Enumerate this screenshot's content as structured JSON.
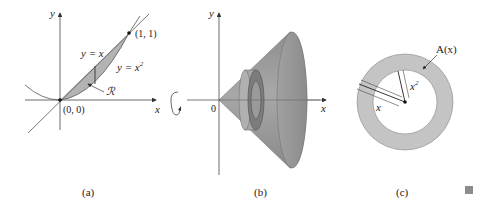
{
  "figure": {
    "panels": [
      {
        "id": "a",
        "caption": "(a)",
        "axis_x_label": "x",
        "axis_y_label": "y",
        "curve_line_label": "y = x",
        "curve_parabola_label_base": "y = x",
        "curve_parabola_label_exp": "2",
        "point_origin_label": "(0, 0)",
        "point_top_label": "(1, 1)",
        "region_label": "ℛ",
        "region_fill": "#b3b3b3"
      },
      {
        "id": "b",
        "caption": "(b)",
        "axis_y_label": "y",
        "origin_label": "0",
        "solid_fill": "#9a9a9a",
        "rotation_indicator": "rotation-arrow"
      },
      {
        "id": "c",
        "caption": "(c)",
        "area_label": "A(x)",
        "outer_radius_label": "x",
        "inner_radius_label_base": "x",
        "inner_radius_label_exp": "2",
        "axis_x_label": "x",
        "annulus_fill": "#c4c4c4"
      }
    ],
    "end_mark_color": "#8c8c8c"
  }
}
